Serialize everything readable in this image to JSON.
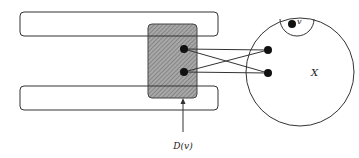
{
  "diagram": {
    "labels": {
      "set_x": "X",
      "vertex_v": "v",
      "d_v": "D(v)"
    },
    "colors": {
      "stroke": "#333333",
      "shade": "#9a9a9a",
      "dot": "#111111",
      "background": "#ffffff"
    },
    "elements": {
      "top_bar": "rounded rectangle (top)",
      "bottom_bar": "rounded rectangle (bottom)",
      "shaded_box": "hatched rectangle D(v)",
      "circle": "set X",
      "inner_arc": "neighborhood of v",
      "edges": 4
    }
  }
}
